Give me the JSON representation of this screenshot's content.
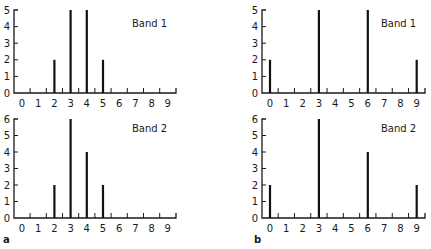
{
  "chart_data": [
    {
      "panel": "a",
      "title": "Band 1",
      "type": "bar",
      "categories": [
        "0",
        "1",
        "2",
        "3",
        "4",
        "5",
        "6",
        "7",
        "8",
        "9"
      ],
      "values": [
        0,
        0,
        2,
        5,
        5,
        2,
        0,
        0,
        0,
        0
      ],
      "ylim": [
        0,
        5
      ],
      "yticks": [
        "0",
        "1",
        "2",
        "3",
        "4",
        "5"
      ],
      "grid": false
    },
    {
      "panel": "a",
      "title": "Band 2",
      "type": "bar",
      "categories": [
        "0",
        "1",
        "2",
        "3",
        "4",
        "5",
        "6",
        "7",
        "8",
        "9"
      ],
      "values": [
        0,
        0,
        2,
        6,
        4,
        2,
        0,
        0,
        0,
        0
      ],
      "ylim": [
        0,
        6
      ],
      "yticks": [
        "0",
        "1",
        "2",
        "3",
        "4",
        "5",
        "6"
      ],
      "grid": false
    },
    {
      "panel": "b",
      "title": "Band 1",
      "type": "bar",
      "categories": [
        "0",
        "1",
        "2",
        "3",
        "4",
        "5",
        "6",
        "7",
        "8",
        "9"
      ],
      "values": [
        2,
        0,
        0,
        5,
        0,
        0,
        5,
        0,
        0,
        2
      ],
      "ylim": [
        0,
        5
      ],
      "yticks": [
        "0",
        "1",
        "2",
        "3",
        "4",
        "5"
      ],
      "grid": false
    },
    {
      "panel": "b",
      "title": "Band 2",
      "type": "bar",
      "categories": [
        "0",
        "1",
        "2",
        "3",
        "4",
        "5",
        "6",
        "7",
        "8",
        "9"
      ],
      "values": [
        2,
        0,
        0,
        6,
        0,
        0,
        4,
        0,
        0,
        2
      ],
      "ylim": [
        0,
        6
      ],
      "yticks": [
        "0",
        "1",
        "2",
        "3",
        "4",
        "5",
        "6"
      ],
      "grid": false
    }
  ],
  "panel_labels": {
    "a": "a",
    "b": "b"
  },
  "layout": [
    {
      "chart": 0,
      "axisX": 14,
      "x0": 22,
      "spacing": 16.2,
      "axisEnd": 176,
      "yTop": 10,
      "yZero": 93,
      "titleX": 132,
      "titleY": 27
    },
    {
      "chart": 1,
      "axisX": 14,
      "x0": 22,
      "spacing": 16.2,
      "axisEnd": 176,
      "yTop": 119,
      "yZero": 218,
      "titleX": 132,
      "titleY": 132
    },
    {
      "chart": 2,
      "axisX": 262,
      "x0": 270,
      "spacing": 16.3,
      "axisEnd": 425,
      "yTop": 10,
      "yZero": 93,
      "titleX": 381,
      "titleY": 27
    },
    {
      "chart": 3,
      "axisX": 262,
      "x0": 270,
      "spacing": 16.3,
      "axisEnd": 425,
      "yTop": 119,
      "yZero": 218,
      "titleX": 381,
      "titleY": 132
    }
  ]
}
